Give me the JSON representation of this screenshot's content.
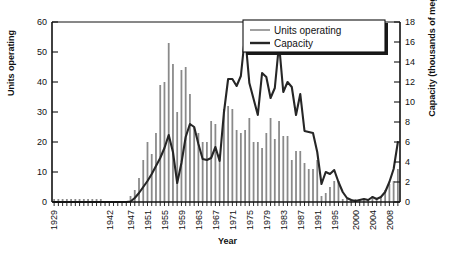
{
  "chart_data": {
    "type": "bar",
    "title": "",
    "xlabel": "Year",
    "ylabel": "Units operating",
    "ylabel_right": "Capacity (thousands of megawatts)",
    "ylim": [
      0,
      60
    ],
    "ylim_right": [
      0,
      18
    ],
    "yticks": [
      0,
      10,
      20,
      30,
      40,
      50,
      60
    ],
    "yticks_right": [
      0,
      2,
      4,
      6,
      8,
      10,
      12,
      14,
      16,
      18
    ],
    "xtick_labels": [
      "1929",
      "1942",
      "1947",
      "1951",
      "1955",
      "1959",
      "1963",
      "1967",
      "1971",
      "1975",
      "1979",
      "1983",
      "1987",
      "1991",
      "1995",
      "2000",
      "2004",
      "2008"
    ],
    "xtick_years": [
      1929,
      1942,
      1947,
      1951,
      1955,
      1959,
      1963,
      1967,
      1971,
      1975,
      1979,
      1983,
      1987,
      1991,
      1995,
      2000,
      2004,
      2008
    ],
    "grid": false,
    "legend_position": "top-right",
    "legend": [
      "Units operating",
      "Capacity"
    ],
    "bar_color": "#8a8a8a",
    "line_color": "#262626",
    "x": [
      1929,
      1930,
      1931,
      1932,
      1933,
      1934,
      1935,
      1936,
      1937,
      1938,
      1939,
      1940,
      1941,
      1942,
      1943,
      1944,
      1945,
      1946,
      1947,
      1948,
      1949,
      1950,
      1951,
      1952,
      1953,
      1954,
      1955,
      1956,
      1957,
      1958,
      1959,
      1960,
      1961,
      1962,
      1963,
      1964,
      1965,
      1966,
      1967,
      1968,
      1969,
      1970,
      1971,
      1972,
      1973,
      1974,
      1975,
      1976,
      1977,
      1978,
      1979,
      1980,
      1981,
      1982,
      1983,
      1984,
      1985,
      1986,
      1987,
      1988,
      1989,
      1990,
      1991,
      1992,
      1993,
      1994,
      1995,
      1996,
      1997,
      1998,
      1999,
      2000,
      2001,
      2002,
      2003,
      2004,
      2005,
      2006,
      2007,
      2008,
      2009,
      2010
    ],
    "series": [
      {
        "name": "Units operating",
        "axis": "left",
        "type": "bar",
        "values": [
          1,
          1,
          1,
          1,
          1,
          1,
          1,
          1,
          1,
          1,
          1,
          1,
          0,
          0,
          0,
          0,
          0,
          0,
          2,
          4,
          8,
          14,
          20,
          16,
          23,
          39,
          40,
          53,
          46,
          30,
          44,
          45,
          36,
          25,
          23,
          20,
          20,
          27,
          26,
          16,
          31,
          32,
          31,
          24,
          23,
          24,
          28,
          20,
          20,
          18,
          23,
          28,
          21,
          27,
          22,
          22,
          14,
          17,
          17,
          13,
          11,
          11,
          14,
          2,
          3,
          5,
          7,
          7,
          1,
          1,
          1,
          1,
          1,
          1,
          1,
          2,
          1,
          2,
          4,
          6,
          7,
          11
        ]
      },
      {
        "name": "Capacity",
        "axis": "right",
        "type": "line",
        "values": [
          0.0,
          0.0,
          0.0,
          0.0,
          0.0,
          0.0,
          0.0,
          0.0,
          0.0,
          0.0,
          0.0,
          0.0,
          0.0,
          0.0,
          0.0,
          0.0,
          0.0,
          0.0,
          0.05,
          0.4,
          0.9,
          1.5,
          2.1,
          2.8,
          3.6,
          4.4,
          5.4,
          6.7,
          5.0,
          1.9,
          3.9,
          6.5,
          7.8,
          7.5,
          5.8,
          4.3,
          4.2,
          4.4,
          5.5,
          4.1,
          8.9,
          12.3,
          12.3,
          11.6,
          12.6,
          16.7,
          11.9,
          10.3,
          8.7,
          12.9,
          12.5,
          10.4,
          11.4,
          15.8,
          11.0,
          12.0,
          11.5,
          8.7,
          10.8,
          7.1,
          7.0,
          6.9,
          5.0,
          1.8,
          3.0,
          2.8,
          3.2,
          2.0,
          1.0,
          0.4,
          0.2,
          0.1,
          0.2,
          0.3,
          0.2,
          0.5,
          0.3,
          0.5,
          1.0,
          2.0,
          3.3,
          6.0
        ]
      }
    ]
  }
}
